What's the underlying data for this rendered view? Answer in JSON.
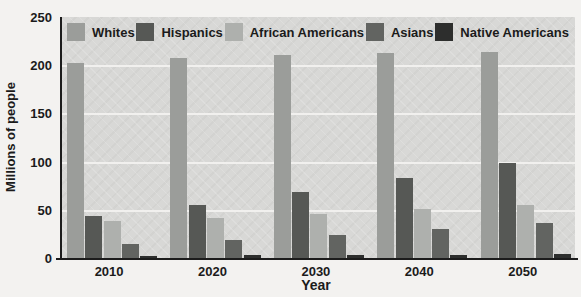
{
  "chart_data": {
    "type": "bar",
    "title": "",
    "categories": [
      "2010",
      "2020",
      "2030",
      "2040",
      "2050"
    ],
    "series": [
      {
        "name": "Whites",
        "color": "#9b9d9a",
        "values": [
          202,
          207,
          211,
          213,
          214
        ]
      },
      {
        "name": "Hispanics",
        "color": "#565855",
        "values": [
          44,
          55,
          68,
          83,
          99
        ]
      },
      {
        "name": "African Americans",
        "color": "#aeb0ad",
        "values": [
          38,
          42,
          46,
          51,
          55
        ]
      },
      {
        "name": "Asians",
        "color": "#626461",
        "values": [
          15,
          19,
          24,
          30,
          36
        ]
      },
      {
        "name": "Native Americans",
        "color": "#2d2e2d",
        "values": [
          2,
          3,
          3,
          3,
          4
        ]
      }
    ],
    "xlabel": "Year",
    "ylabel": "Millions of people",
    "ylim": [
      0,
      250
    ],
    "yticks": [
      0,
      50,
      100,
      150,
      200,
      250
    ],
    "grid": true,
    "legend_position": "top-inside",
    "colors": {
      "plot_background": "#d8d8d6",
      "gridline": "#f1f0ee",
      "axis": "#1c1c1c",
      "text": "#1b1b1b",
      "page_background": "#f3f2f0"
    }
  }
}
